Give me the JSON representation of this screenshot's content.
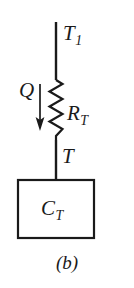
{
  "figure": {
    "caption": "(b)",
    "background_color": "#ffffff",
    "ink_color": "#1a1a1a",
    "width": 134,
    "height": 288
  },
  "labels": {
    "source_temperature": {
      "symbol": "T",
      "subscript": "1",
      "text": "T1"
    },
    "heat_flow": {
      "symbol": "Q",
      "subscript": "",
      "text": "Q"
    },
    "thermal_resistance": {
      "symbol": "R",
      "subscript": "T",
      "text": "RT"
    },
    "node_temperature": {
      "symbol": "T",
      "subscript": "",
      "text": "T"
    },
    "thermal_capacitance": {
      "symbol": "C",
      "subscript": "T",
      "text": "CT"
    }
  },
  "components": {
    "top_wire": {
      "name": "wire-top",
      "x": 56,
      "y_start": 22,
      "y_end": 80
    },
    "resistor": {
      "name": "resistor-zigzag",
      "x_center": 56,
      "y_start": 80,
      "y_end": 140,
      "amplitude": 7,
      "segments": 8
    },
    "bottom_wire": {
      "name": "wire-bottom",
      "x": 56,
      "y_start": 140,
      "y_end": 180
    },
    "arrow": {
      "name": "heat-flow-arrow",
      "x": 40,
      "y_start": 84,
      "y_end": 130,
      "direction": "down"
    },
    "capacitor_box": {
      "name": "capacitance-block",
      "x": 18,
      "y": 180,
      "width": 76,
      "height": 58
    }
  }
}
